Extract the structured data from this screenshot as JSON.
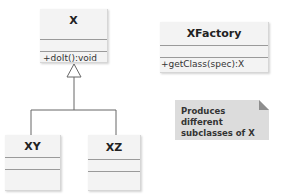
{
  "diagram": {
    "type": "uml-class-diagram",
    "classes": [
      {
        "id": "X",
        "name": "X",
        "attributes": [],
        "operations": [
          "+doIt():void"
        ]
      },
      {
        "id": "XY",
        "name": "XY",
        "attributes": [],
        "operations": []
      },
      {
        "id": "XZ",
        "name": "XZ",
        "attributes": [],
        "operations": []
      },
      {
        "id": "XFactory",
        "name": "XFactory",
        "attributes": [],
        "operations": [
          "+getClass(spec):X"
        ]
      }
    ],
    "relationships": [
      {
        "type": "generalization",
        "from": "XY",
        "to": "X"
      },
      {
        "type": "generalization",
        "from": "XZ",
        "to": "X"
      }
    ],
    "note": {
      "line1": "Produces different",
      "line2": "subclasses of X"
    }
  },
  "colors": {
    "class_fill": "#f3f3f3",
    "separator": "#9a9a9a",
    "line": "#666666",
    "note_fill": "#dcdcdc",
    "note_fold": "#8e8e8e"
  }
}
